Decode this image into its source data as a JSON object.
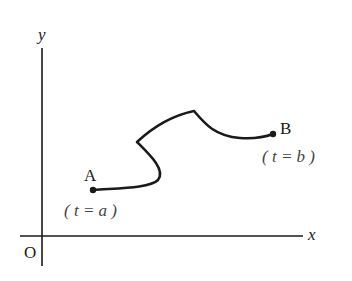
{
  "diagram": {
    "type": "parametric-curve",
    "axes": {
      "x_label": "x",
      "y_label": "y",
      "origin_label": "O"
    },
    "points": [
      {
        "id": "A",
        "label": "A",
        "param_text": "( t = a )",
        "x": 93,
        "y": 190
      },
      {
        "id": "B",
        "label": "B",
        "param_text": "( t = b )",
        "x": 273,
        "y": 134
      }
    ],
    "colors": {
      "ink": "#1a1a1a",
      "background": "#ffffff"
    }
  }
}
